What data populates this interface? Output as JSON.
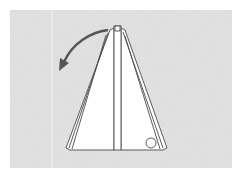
{
  "diagram": {
    "type": "origami-fold-step",
    "colors": {
      "page": "#ffffff",
      "paper_texture": "#dedede",
      "model_fill": "#ffffff",
      "outline": "#4a4a4a",
      "arrow": "#555555"
    },
    "elements": {
      "background_sheet": "textured gray paper",
      "fold_line": "vertical crease line on background",
      "model": "triangular folded paper with central strip",
      "arrow": "curved arrow pointing down-left from apex",
      "marker": "small circle at lower-right corner of model"
    }
  }
}
